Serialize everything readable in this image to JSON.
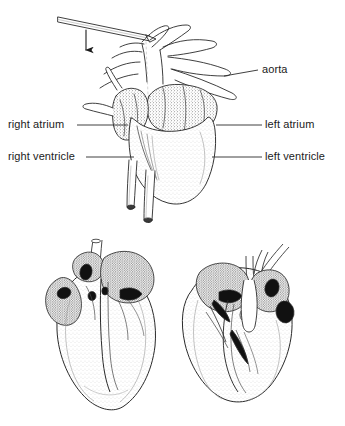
{
  "figure": {
    "background_color": "#ffffff",
    "ink_color": "#1b1b1b",
    "line_color": "#2a2a2a",
    "shade_color": "#d8d8d8"
  },
  "labels": {
    "aorta": "aorta",
    "left_atrium": "left atrium",
    "left_ventricle": "left ventricle",
    "right_atrium": "right atrium",
    "right_ventricle": "right ventricle"
  },
  "annotations": {
    "probe": "probe-rod",
    "arrow": "down-arrow"
  },
  "panels": {
    "top": "whole-heart-external-view",
    "bottom_left": "dissected-heart-coronal-section-left",
    "bottom_right": "dissected-heart-coronal-section-right"
  }
}
